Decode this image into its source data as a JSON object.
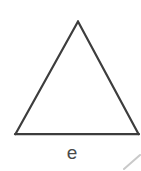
{
  "figure": {
    "type": "geometry-diagram",
    "background_color": "#ffffff",
    "stroke_color": "#3d3d3d",
    "stroke_width": 2.2,
    "canvas": {
      "width": 141,
      "height": 171
    },
    "shapes": {
      "triangle": {
        "name": "triangle-outline",
        "apex": {
          "x": 78,
          "y": 21
        },
        "base_left": {
          "x": 15,
          "y": 134
        },
        "base_right": {
          "x": 139,
          "y": 134
        },
        "closed": true
      },
      "partial_stroke": {
        "name": "cropped-diagonal-fragment",
        "color": "#c9c9c9",
        "stroke_width": 2.0,
        "from": {
          "x": 124,
          "y": 168
        },
        "to": {
          "x": 139,
          "y": 156
        }
      }
    },
    "labels": {
      "side_label": {
        "text": "e",
        "color": "#4a4a4a",
        "font_size": 19,
        "position": {
          "x": 72,
          "y": 155
        }
      }
    }
  }
}
